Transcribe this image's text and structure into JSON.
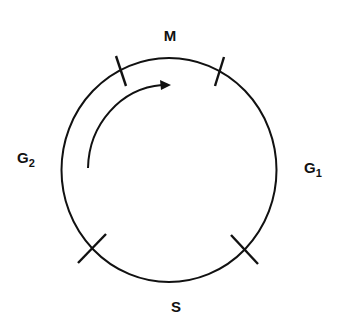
{
  "diagram": {
    "phases": [
      {
        "id": "M",
        "label": "M",
        "subscript": ""
      },
      {
        "id": "G1",
        "label": "G",
        "subscript": "1"
      },
      {
        "id": "S",
        "label": "S",
        "subscript": ""
      },
      {
        "id": "G2",
        "label": "G",
        "subscript": "2"
      }
    ],
    "arrow_direction": "clockwise",
    "colors": {
      "stroke": "#111111",
      "background": "#ffffff"
    }
  }
}
